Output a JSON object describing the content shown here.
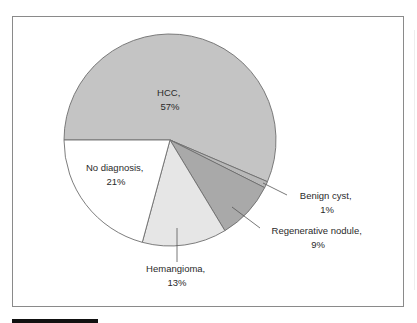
{
  "chart_data": {
    "type": "pie",
    "title": "",
    "categories": [
      "HCC",
      "Benign cyst",
      "Regenerative nodule",
      "Hemangioma",
      "No diagnosis"
    ],
    "values": [
      57,
      1,
      9,
      13,
      21
    ],
    "unit": "%",
    "labels": [
      {
        "name": "HCC,",
        "value": "57%"
      },
      {
        "name": "Benign cyst,",
        "value": "1%"
      },
      {
        "name": "Regenerative nodule,",
        "value": "9%"
      },
      {
        "name": "Hemangioma,",
        "value": "13%"
      },
      {
        "name": "No diagnosis,",
        "value": "21%"
      }
    ],
    "colors": [
      "#c4c4c4",
      "#b8b8b8",
      "#a9a9a9",
      "#e6e6e6",
      "#ffffff"
    ],
    "start_angle_deg": 180,
    "direction": "clockwise",
    "legend": "none (inline labels with leader lines)"
  }
}
